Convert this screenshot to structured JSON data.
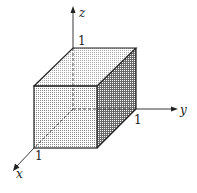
{
  "diagram": {
    "type": "unit-cube-3d-axes",
    "axes": {
      "x": {
        "label": "x",
        "tick": "1"
      },
      "y": {
        "label": "y",
        "tick": "1"
      },
      "z": {
        "label": "z",
        "tick": "1"
      }
    },
    "colors": {
      "line": "#222222",
      "face_front": "#cfcfcf",
      "face_top": "#e2e2e2",
      "face_side": "#9a9a9a"
    }
  }
}
